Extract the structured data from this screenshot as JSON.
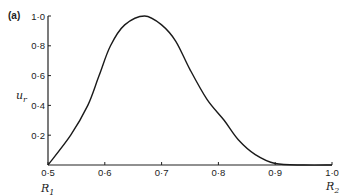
{
  "panel_label": "(a)",
  "chart_data": {
    "type": "line",
    "title": "",
    "panel": "(a)",
    "xlabel": "",
    "ylabel": "u_r",
    "xlim": [
      0.5,
      1.0
    ],
    "ylim": [
      0,
      1.0
    ],
    "grid": false,
    "legend": null,
    "x_ticks": [
      0.5,
      0.6,
      0.7,
      0.8,
      0.9,
      1.0
    ],
    "x_tick_labels": [
      "0·5",
      "0·6",
      "0·7",
      "0·8",
      "0·9",
      "1·0"
    ],
    "y_ticks": [
      0.2,
      0.4,
      0.6,
      0.8,
      1.0
    ],
    "y_tick_labels": [
      "0·2",
      "0·4",
      "0·6",
      "0·8",
      "1·0"
    ],
    "annotations": [
      {
        "text": "R₁",
        "x": 0.5,
        "position": "below x-axis"
      },
      {
        "text": "R₂",
        "x": 1.0,
        "position": "below x-axis"
      }
    ],
    "series": [
      {
        "name": "u_r",
        "x": [
          0.5,
          0.54,
          0.57,
          0.59,
          0.61,
          0.635,
          0.67,
          0.7,
          0.725,
          0.75,
          0.78,
          0.81,
          0.835,
          0.865,
          0.9,
          0.95,
          1.0
        ],
        "y": [
          0.0,
          0.2,
          0.4,
          0.6,
          0.8,
          0.94,
          1.0,
          0.94,
          0.83,
          0.64,
          0.44,
          0.3,
          0.17,
          0.07,
          0.01,
          0.0,
          0.0
        ]
      }
    ]
  },
  "labels": {
    "ylabel_main": "u",
    "ylabel_sub": "r",
    "r1_main": "R",
    "r1_sub": "1",
    "r2_main": "R",
    "r2_sub": "2"
  }
}
